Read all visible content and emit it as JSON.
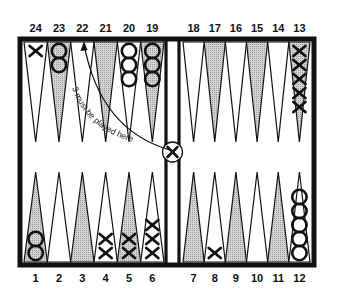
{
  "diagram": {
    "top_labels": [
      "24",
      "23",
      "22",
      "21",
      "20",
      "19",
      "18",
      "17",
      "16",
      "15",
      "14",
      "13"
    ],
    "bottom_labels": [
      "1",
      "2",
      "3",
      "4",
      "5",
      "6",
      "7",
      "8",
      "9",
      "10",
      "11",
      "12"
    ],
    "annotation": "3 must be played here",
    "colors": {
      "frame": "#111111",
      "shaded_point": "#c8c8c8",
      "open_point": "#ffffff",
      "checker_stroke": "#111111"
    },
    "points": [
      {
        "n": 1,
        "shaded": true,
        "checkers": "O",
        "count": 2
      },
      {
        "n": 2,
        "shaded": false,
        "checkers": "",
        "count": 0
      },
      {
        "n": 3,
        "shaded": true,
        "checkers": "",
        "count": 0
      },
      {
        "n": 4,
        "shaded": false,
        "checkers": "X",
        "count": 2
      },
      {
        "n": 5,
        "shaded": true,
        "checkers": "X",
        "count": 2
      },
      {
        "n": 6,
        "shaded": false,
        "checkers": "X",
        "count": 3
      },
      {
        "n": 7,
        "shaded": true,
        "checkers": "",
        "count": 0
      },
      {
        "n": 8,
        "shaded": false,
        "checkers": "X",
        "count": 1
      },
      {
        "n": 9,
        "shaded": true,
        "checkers": "",
        "count": 0
      },
      {
        "n": 10,
        "shaded": false,
        "checkers": "",
        "count": 0
      },
      {
        "n": 11,
        "shaded": true,
        "checkers": "",
        "count": 0
      },
      {
        "n": 12,
        "shaded": false,
        "checkers": "O",
        "count": 5
      },
      {
        "n": 13,
        "shaded": true,
        "checkers": "X",
        "count": 5
      },
      {
        "n": 14,
        "shaded": false,
        "checkers": "",
        "count": 0
      },
      {
        "n": 15,
        "shaded": true,
        "checkers": "",
        "count": 0
      },
      {
        "n": 16,
        "shaded": false,
        "checkers": "",
        "count": 0
      },
      {
        "n": 17,
        "shaded": true,
        "checkers": "",
        "count": 0
      },
      {
        "n": 18,
        "shaded": false,
        "checkers": "",
        "count": 0
      },
      {
        "n": 19,
        "shaded": true,
        "checkers": "O",
        "count": 3
      },
      {
        "n": 20,
        "shaded": false,
        "checkers": "O",
        "count": 3
      },
      {
        "n": 21,
        "shaded": true,
        "checkers": "",
        "count": 0
      },
      {
        "n": 22,
        "shaded": false,
        "checkers": "",
        "count": 0
      },
      {
        "n": 23,
        "shaded": true,
        "checkers": "O",
        "count": 2
      },
      {
        "n": 24,
        "shaded": false,
        "checkers": "X",
        "count": 1
      }
    ],
    "bar": {
      "checkers": "X",
      "count": 1
    }
  }
}
